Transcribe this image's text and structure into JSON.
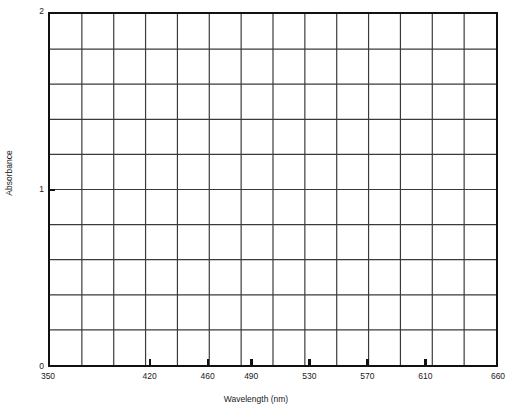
{
  "figure": {
    "title_remnant": "· ·",
    "background_color": "#ffffff",
    "frame_color": "#111111",
    "grid_color": "#3a3a3a"
  },
  "chart_data": {
    "type": "line",
    "title": "",
    "xlabel": "Wavelength (nm)",
    "ylabel": "Absorbance",
    "xlim": [
      350,
      660
    ],
    "ylim": [
      0,
      2
    ],
    "grid": true,
    "legend": null,
    "series": [],
    "values": [],
    "x": [],
    "note": "Blank spectrum grid template - no data plotted",
    "x_tick_labels": [
      "350",
      "420",
      "460",
      "490",
      "530",
      "570",
      "610",
      "660"
    ],
    "x_tick_values": [
      350,
      420,
      460,
      490,
      530,
      570,
      610,
      660
    ],
    "y_tick_labels": [
      "0",
      "1",
      "2"
    ],
    "y_tick_values": [
      0,
      1,
      2
    ],
    "x_gridline_count": 13,
    "y_gridline_count": 9,
    "y_grid_step": 0.2
  }
}
